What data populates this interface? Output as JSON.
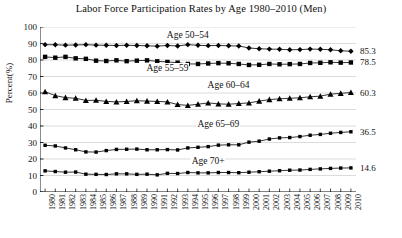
{
  "chart_data": {
    "type": "line",
    "title": "Labor Force Participation Rates by Age 1980–2010 (Men)",
    "xlabel": "",
    "ylabel": "Percent(%)",
    "ylim": [
      0,
      100
    ],
    "ytick_step": 10,
    "yticks": [
      0,
      10,
      20,
      30,
      40,
      50,
      60,
      70,
      80,
      90,
      100
    ],
    "grid": true,
    "legend_position": "inline-labels",
    "x": [
      1980,
      1981,
      1982,
      1983,
      1984,
      1985,
      1986,
      1987,
      1988,
      1989,
      1990,
      1991,
      1992,
      1993,
      1994,
      1995,
      1996,
      1997,
      1998,
      1999,
      2000,
      2001,
      2002,
      2003,
      2004,
      2005,
      2006,
      2007,
      2008,
      2009,
      2010
    ],
    "series": [
      {
        "name": "Age 50–54",
        "marker": "diamond",
        "end_value": "85.3",
        "label_x": 1994,
        "label_y": 95,
        "values": [
          89.3,
          89.2,
          89.0,
          89.1,
          89.3,
          89.0,
          88.9,
          88.8,
          88.9,
          88.8,
          88.6,
          88.4,
          88.8,
          88.5,
          89.3,
          88.9,
          88.7,
          88.8,
          88.6,
          88.5,
          87.3,
          86.8,
          86.6,
          86.5,
          86.2,
          86.3,
          86.6,
          86.5,
          86.2,
          85.6,
          85.3
        ]
      },
      {
        "name": "Age 55–59",
        "marker": "square",
        "end_value": "78.5",
        "label_x": 1992,
        "label_y": 75,
        "values": [
          81.9,
          81.4,
          81.9,
          81.0,
          80.7,
          79.6,
          79.4,
          79.8,
          79.3,
          79.6,
          79.8,
          79.2,
          78.8,
          78.4,
          77.6,
          77.6,
          77.9,
          78.1,
          78.0,
          77.6,
          77.0,
          77.1,
          77.6,
          77.4,
          77.5,
          77.6,
          78.2,
          78.3,
          78.6,
          78.4,
          78.5
        ]
      },
      {
        "name": "Age 60–64",
        "marker": "triangle",
        "end_value": "60.3",
        "label_x": 1998,
        "label_y": 65,
        "values": [
          60.8,
          58.4,
          57.2,
          56.8,
          55.5,
          55.6,
          54.9,
          54.6,
          54.9,
          55.3,
          55.1,
          54.9,
          54.6,
          53.0,
          52.5,
          53.2,
          54.0,
          53.4,
          53.2,
          53.6,
          54.0,
          55.1,
          56.0,
          56.5,
          56.8,
          57.1,
          57.7,
          58.1,
          59.3,
          59.8,
          60.3
        ]
      },
      {
        "name": "Age 65–69",
        "marker": "square-small",
        "end_value": "36.5",
        "label_x": 1997,
        "label_y": 41,
        "values": [
          28.3,
          27.9,
          26.7,
          25.6,
          24.3,
          24.2,
          25.1,
          25.8,
          25.9,
          26.0,
          25.6,
          25.6,
          25.7,
          25.5,
          26.7,
          27.1,
          27.5,
          28.4,
          28.6,
          28.6,
          30.2,
          30.8,
          32.1,
          32.8,
          33.0,
          33.6,
          34.4,
          34.9,
          35.6,
          36.1,
          36.5
        ]
      },
      {
        "name": "Age 70+",
        "marker": "square-small",
        "end_value": "14.6",
        "label_x": 1996,
        "label_y": 19,
        "values": [
          12.8,
          12.4,
          12.0,
          12.1,
          10.8,
          10.7,
          10.6,
          11.0,
          11.0,
          10.7,
          10.8,
          10.4,
          11.3,
          11.2,
          11.8,
          11.6,
          11.6,
          11.8,
          11.8,
          11.7,
          12.0,
          12.3,
          12.6,
          12.9,
          13.2,
          13.3,
          13.7,
          14.0,
          14.3,
          14.5,
          14.6
        ]
      }
    ]
  }
}
